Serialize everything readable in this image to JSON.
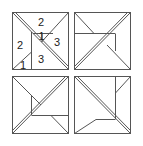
{
  "figure": {
    "stroke_color": "#555555",
    "background": "#ffffff",
    "panels": [
      {
        "id": "top-left",
        "labels": [
          {
            "text": "2",
            "x": 38,
            "y": 26
          },
          {
            "text": "1",
            "x": 38,
            "y": 39
          },
          {
            "text": "3",
            "x": 55,
            "y": 45
          },
          {
            "text": "2",
            "x": 19,
            "y": 48
          },
          {
            "text": "3",
            "x": 40,
            "y": 65
          },
          {
            "text": "1",
            "x": 21,
            "y": 73
          }
        ]
      },
      {
        "id": "top-right",
        "labels": []
      },
      {
        "id": "bottom-left",
        "labels": []
      },
      {
        "id": "bottom-right",
        "labels": []
      }
    ]
  }
}
